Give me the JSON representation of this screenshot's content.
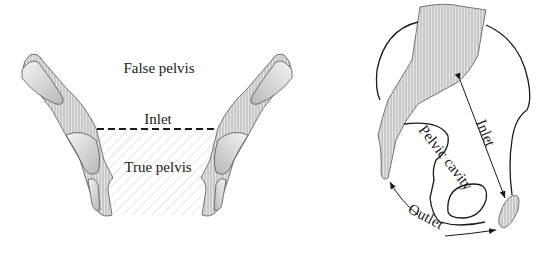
{
  "left_figure": {
    "title": "Frontal view of pelvis",
    "labels": {
      "false_pelvis": "False pelvis",
      "inlet": "Inlet",
      "true_pelvis": "True pelvis"
    }
  },
  "right_figure": {
    "title": "Sagittal view of pelvis",
    "labels": {
      "inlet": "Inlet",
      "pelvic_cavity": "Pelvic cavity",
      "outlet": "Outlet"
    }
  },
  "colors": {
    "line": "#1a1a1a",
    "bone_fill": "#d9d9d9",
    "hatch": "#9a9a9a"
  }
}
